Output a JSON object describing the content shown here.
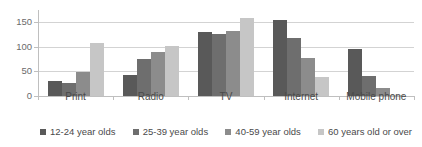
{
  "chart_data": {
    "type": "bar",
    "title": "",
    "xlabel": "",
    "ylabel": "",
    "ylim": [
      0,
      175
    ],
    "yticks": [
      0,
      50,
      100,
      150
    ],
    "grid": true,
    "legend_position": "bottom",
    "categories": [
      "Print",
      "Radio",
      "TV",
      "Internet",
      "Mobile phone"
    ],
    "series": [
      {
        "name": "12-24 year olds",
        "color": "#595959",
        "values": [
          30,
          43,
          130,
          155,
          96
        ]
      },
      {
        "name": "25-39 year olds",
        "color": "#6e6e6e",
        "values": [
          27,
          75,
          127,
          118,
          40
        ]
      },
      {
        "name": "40-59 year olds",
        "color": "#8c8c8c",
        "values": [
          49,
          90,
          133,
          77,
          16
        ]
      },
      {
        "name": "60 years old or over",
        "color": "#c6c6c6",
        "values": [
          107,
          102,
          158,
          39,
          3
        ]
      }
    ]
  },
  "axis": {
    "y_tick_labels": [
      "0",
      "50",
      "100",
      "150"
    ]
  }
}
